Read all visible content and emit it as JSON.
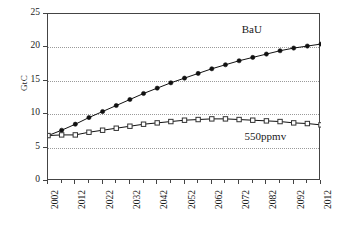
{
  "chart_data": {
    "type": "line",
    "title": "",
    "xlabel": "",
    "ylabel": "GtC",
    "xlim": [
      2002,
      2102
    ],
    "ylim": [
      0,
      25
    ],
    "grid": true,
    "legend_position": "inline-annotation",
    "y_ticks": [
      0,
      5,
      10,
      15,
      20,
      25
    ],
    "x_ticks": [
      2002,
      2007,
      2012,
      2017,
      2022,
      2027,
      2032,
      2037,
      2042,
      2047,
      2052,
      2057,
      2062,
      2067,
      2072,
      2077,
      2082,
      2087,
      2092,
      2097,
      2102
    ],
    "x_tick_labels": [
      "2002",
      "2012",
      "2022",
      "2032",
      "2042",
      "2052",
      "2062",
      "2072",
      "2082",
      "2092",
      "2012"
    ],
    "x_tick_label_years": [
      2002,
      2012,
      2022,
      2032,
      2042,
      2052,
      2062,
      2072,
      2082,
      2092,
      2102
    ],
    "x": [
      2002,
      2007,
      2012,
      2017,
      2022,
      2027,
      2032,
      2037,
      2042,
      2047,
      2052,
      2057,
      2062,
      2067,
      2072,
      2077,
      2082,
      2087,
      2092,
      2097,
      2102
    ],
    "series": [
      {
        "name": "BaU",
        "marker": "filled-circle",
        "color": "#111111",
        "values": [
          6.8,
          7.6,
          8.5,
          9.5,
          10.4,
          11.3,
          12.2,
          13.1,
          13.9,
          14.7,
          15.4,
          16.1,
          16.8,
          17.4,
          18.0,
          18.5,
          19.0,
          19.5,
          19.9,
          20.2,
          20.5
        ]
      },
      {
        "name": "550ppmv",
        "marker": "open-square",
        "color": "#333333",
        "values": [
          6.8,
          6.9,
          6.9,
          7.3,
          7.6,
          7.9,
          8.2,
          8.5,
          8.7,
          8.9,
          9.1,
          9.2,
          9.3,
          9.3,
          9.2,
          9.1,
          9.0,
          8.9,
          8.7,
          8.6,
          8.4
        ]
      }
    ],
    "annotations": [
      {
        "text": "BaU",
        "year": 2077,
        "value": 22.6
      },
      {
        "text": "550ppmv",
        "year": 2082,
        "value": 6.6
      }
    ]
  }
}
